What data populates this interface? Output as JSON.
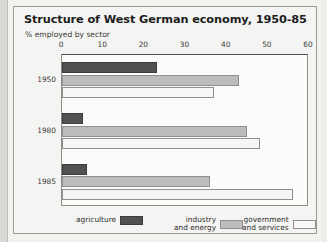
{
  "chart_data": {
    "type": "bar",
    "orientation": "horizontal",
    "title": "Structure of West German economy, 1950-85",
    "subtitle": "% employed by sector",
    "xlabel": "",
    "ylabel": "",
    "xlim": [
      0,
      60
    ],
    "xticks": [
      0,
      10,
      20,
      30,
      40,
      50,
      60
    ],
    "grid": false,
    "legend_position": "bottom",
    "categories": [
      "1950",
      "1980",
      "1985"
    ],
    "series": [
      {
        "name": "agriculture",
        "color": "#515151",
        "values": [
          23,
          5,
          6
        ]
      },
      {
        "name": "industry and energy",
        "color": "#bcbcbc",
        "values": [
          43,
          45,
          36
        ]
      },
      {
        "name": "government and services",
        "color": "#f6f6f4",
        "values": [
          37,
          48,
          56
        ]
      }
    ]
  },
  "legend": {
    "items": [
      {
        "label": "agriculture",
        "swatch": "agriculture"
      },
      {
        "label": "industry\nand energy",
        "swatch": "industry"
      },
      {
        "label": "government\nand services",
        "swatch": "government"
      }
    ]
  }
}
